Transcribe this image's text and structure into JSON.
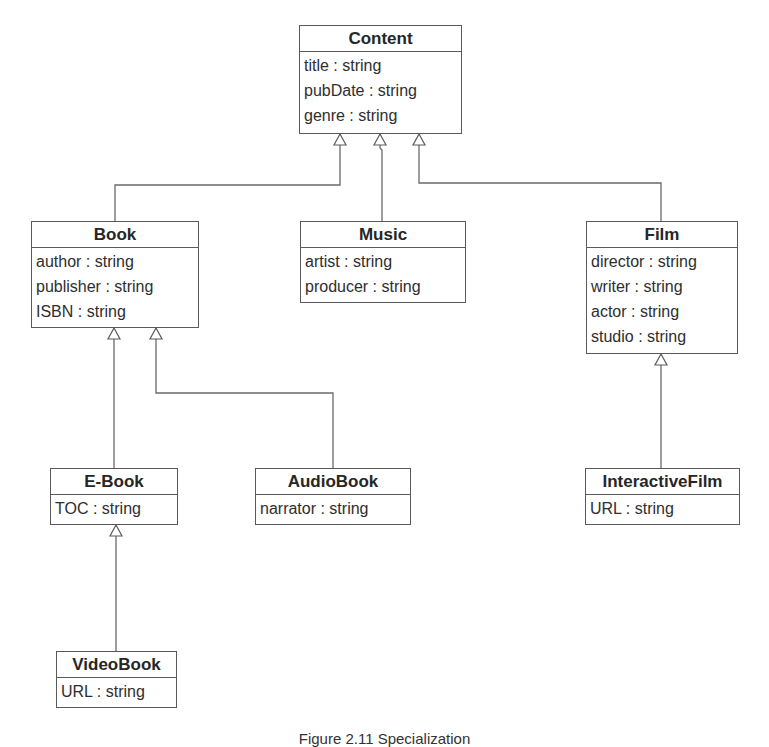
{
  "diagram": {
    "type": "uml-class-diagram",
    "classes": [
      {
        "id": "content",
        "name": "Content",
        "attributes": [
          "title : string",
          "pubDate : string",
          "genre : string"
        ]
      },
      {
        "id": "book",
        "name": "Book",
        "attributes": [
          "author : string",
          "publisher : string",
          "ISBN : string"
        ]
      },
      {
        "id": "music",
        "name": "Music",
        "attributes": [
          "artist : string",
          "producer : string"
        ]
      },
      {
        "id": "film",
        "name": "Film",
        "attributes": [
          "director : string",
          "writer : string",
          "actor : string",
          "studio : string"
        ]
      },
      {
        "id": "ebook",
        "name": "E-Book",
        "attributes": [
          "TOC : string"
        ]
      },
      {
        "id": "audiobook",
        "name": "AudioBook",
        "attributes": [
          "narrator : string"
        ]
      },
      {
        "id": "interactivefilm",
        "name": "InteractiveFilm",
        "attributes": [
          "URL : string"
        ]
      },
      {
        "id": "videobook",
        "name": "VideoBook",
        "attributes": [
          "URL : string"
        ]
      }
    ],
    "generalizations": [
      {
        "child": "Book",
        "parent": "Content"
      },
      {
        "child": "Music",
        "parent": "Content"
      },
      {
        "child": "Film",
        "parent": "Content"
      },
      {
        "child": "E-Book",
        "parent": "Book"
      },
      {
        "child": "AudioBook",
        "parent": "Book"
      },
      {
        "child": "InteractiveFilm",
        "parent": "Film"
      },
      {
        "child": "VideoBook",
        "parent": "E-Book"
      }
    ],
    "colors": {
      "line": "#5a5a5a",
      "text": "#2b2b2b",
      "background": "#ffffff"
    }
  },
  "caption": "Figure 2.11  Specialization"
}
